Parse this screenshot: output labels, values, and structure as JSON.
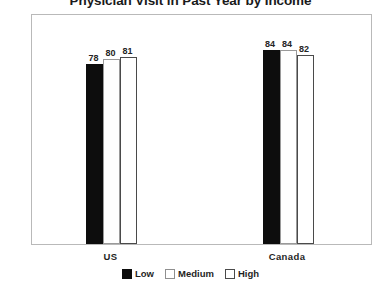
{
  "chart_data": {
    "type": "bar",
    "title": "Physician Visit in Past Year by Income",
    "xlabel": "",
    "ylabel": "",
    "ylim": [
      0,
      100
    ],
    "yticks": [
      0,
      20,
      40,
      60,
      80,
      100
    ],
    "grid": false,
    "legend_position": "bottom",
    "categories": [
      "US",
      "Canada"
    ],
    "series": [
      {
        "name": "Low",
        "values": [
          78,
          84
        ],
        "color": "#0d0d0d"
      },
      {
        "name": "Medium",
        "values": [
          80,
          84
        ],
        "color": "#ffffff"
      },
      {
        "name": "High",
        "values": [
          81,
          82
        ],
        "color": "#ffffff"
      }
    ]
  },
  "axis": {
    "y_tick_labels": [
      "100",
      "80",
      "60",
      "40",
      "20",
      "0"
    ]
  },
  "groups": [
    {
      "label": "US",
      "bars": [
        {
          "series": "Low",
          "value_label": "78"
        },
        {
          "series": "Medium",
          "value_label": "80"
        },
        {
          "series": "High",
          "value_label": "81"
        }
      ]
    },
    {
      "label": "Canada",
      "bars": [
        {
          "series": "Low",
          "value_label": "84"
        },
        {
          "series": "Medium",
          "value_label": "84"
        },
        {
          "series": "High",
          "value_label": "82"
        }
      ]
    }
  ],
  "legend": {
    "entries": [
      {
        "label": "Low"
      },
      {
        "label": "Medium"
      },
      {
        "label": "High"
      }
    ]
  }
}
